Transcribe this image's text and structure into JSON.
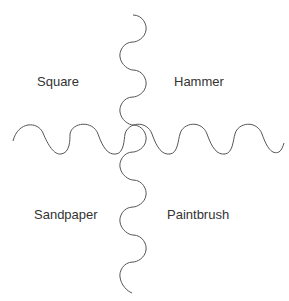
{
  "diagram": {
    "quadrants": {
      "top_left": "Square",
      "top_right": "Hammer",
      "bottom_left": "Sandpaper",
      "bottom_right": "Paintbrush"
    },
    "dividers": {
      "vertical": "wavy line",
      "horizontal": "wavy line"
    },
    "stroke_color": "#555555"
  }
}
